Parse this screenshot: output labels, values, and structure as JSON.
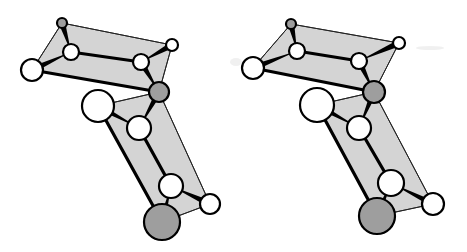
{
  "figure": {
    "type": "stereo-pair molecular structure diagram",
    "colors": {
      "background": "#ffffff",
      "plane_fill": "#d4d4d4",
      "atom_white": "#ffffff",
      "atom_gray": "#9e9e9e",
      "stroke": "#000000"
    },
    "views": [
      {
        "name": "left-view",
        "atoms": [
          {
            "id": "a1",
            "x": 62,
            "y": 23,
            "r": 5,
            "color": "gray"
          },
          {
            "id": "a2",
            "x": 71,
            "y": 52,
            "r": 8,
            "color": "white"
          },
          {
            "id": "a3",
            "x": 32,
            "y": 70,
            "r": 11,
            "color": "white"
          },
          {
            "id": "a4",
            "x": 172,
            "y": 45,
            "r": 6,
            "color": "white"
          },
          {
            "id": "a5",
            "x": 141,
            "y": 62,
            "r": 8,
            "color": "white"
          },
          {
            "id": "a6",
            "x": 159,
            "y": 92,
            "r": 10,
            "color": "gray"
          },
          {
            "id": "a7",
            "x": 98,
            "y": 106,
            "r": 16,
            "color": "white"
          },
          {
            "id": "a8",
            "x": 139,
            "y": 128,
            "r": 12,
            "color": "white"
          },
          {
            "id": "a9",
            "x": 171,
            "y": 186,
            "r": 12,
            "color": "white"
          },
          {
            "id": "a10",
            "x": 210,
            "y": 204,
            "r": 10,
            "color": "white"
          },
          {
            "id": "a11",
            "x": 162,
            "y": 222,
            "r": 18,
            "color": "gray"
          }
        ]
      },
      {
        "name": "right-view",
        "atoms": [
          {
            "id": "a1",
            "x": 291,
            "y": 24,
            "r": 5,
            "color": "gray"
          },
          {
            "id": "a2",
            "x": 297,
            "y": 51,
            "r": 8,
            "color": "white"
          },
          {
            "id": "a3",
            "x": 253,
            "y": 68,
            "r": 11,
            "color": "white"
          },
          {
            "id": "a4",
            "x": 399,
            "y": 43,
            "r": 6,
            "color": "white"
          },
          {
            "id": "a5",
            "x": 359,
            "y": 61,
            "r": 8,
            "color": "white"
          },
          {
            "id": "a6",
            "x": 374,
            "y": 92,
            "r": 11,
            "color": "gray"
          },
          {
            "id": "a7",
            "x": 317,
            "y": 105,
            "r": 17,
            "color": "white"
          },
          {
            "id": "a8",
            "x": 359,
            "y": 128,
            "r": 12,
            "color": "white"
          },
          {
            "id": "a9",
            "x": 391,
            "y": 183,
            "r": 13,
            "color": "white"
          },
          {
            "id": "a10",
            "x": 433,
            "y": 204,
            "r": 11,
            "color": "white"
          },
          {
            "id": "a11",
            "x": 377,
            "y": 216,
            "r": 18,
            "color": "gray"
          }
        ]
      }
    ],
    "planes": [
      {
        "name": "upper-plane",
        "vertices": [
          "a1",
          "a4",
          "a6",
          "a3"
        ]
      },
      {
        "name": "lower-plane",
        "vertices": [
          "a7",
          "a6",
          "a10",
          "a11"
        ]
      }
    ],
    "thick_bonds": [
      [
        "a3",
        "a6"
      ],
      [
        "a2",
        "a5"
      ],
      [
        "a7",
        "a11"
      ],
      [
        "a8",
        "a9"
      ]
    ],
    "thin_edges": [
      [
        "a1",
        "a4"
      ],
      [
        "a1",
        "a3"
      ],
      [
        "a4",
        "a6"
      ],
      [
        "a7",
        "a6"
      ],
      [
        "a6",
        "a10"
      ],
      [
        "a10",
        "a11"
      ]
    ],
    "wedge_bonds": [
      [
        "a3",
        "a2"
      ],
      [
        "a1",
        "a2"
      ],
      [
        "a4",
        "a5"
      ],
      [
        "a5",
        "a6"
      ],
      [
        "a7",
        "a8"
      ],
      [
        "a6",
        "a8"
      ],
      [
        "a10",
        "a9"
      ],
      [
        "a11",
        "a9"
      ]
    ]
  }
}
